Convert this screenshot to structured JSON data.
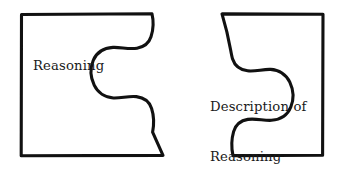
{
  "diagram": {
    "type": "jigsaw-puzzle-two-pieces",
    "background_color": "#ffffff",
    "stroke_color": "#111111",
    "text_color": "#1a1a1a",
    "left_piece": {
      "label": "Reasoning",
      "tab_type": "socket"
    },
    "right_piece": {
      "label_line_1": "Description of",
      "label_line_2": "Reasoning",
      "tab_type": "socket"
    }
  }
}
